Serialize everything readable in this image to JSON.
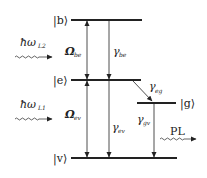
{
  "diagram": {
    "type": "energy-level",
    "levels": [
      {
        "id": "b",
        "label": "|b⟩",
        "y": 20,
        "x1": 71,
        "x2": 142
      },
      {
        "id": "e",
        "label": "|e⟩",
        "y": 80,
        "x1": 71,
        "x2": 141
      },
      {
        "id": "g",
        "label": "|g⟩",
        "y": 103,
        "x1": 137,
        "x2": 176
      },
      {
        "id": "v",
        "label": "|v⟩",
        "y": 158,
        "x1": 71,
        "x2": 177
      }
    ],
    "transitions": [
      {
        "id": "omega_be",
        "symbol": "Ω",
        "sub": "be",
        "kind": "coupling",
        "from": "b",
        "to": "e"
      },
      {
        "id": "gamma_be",
        "symbol": "γ",
        "sub": "be",
        "kind": "decay",
        "from": "b",
        "to": "e"
      },
      {
        "id": "omega_ev",
        "symbol": "Ω",
        "sub": "ev",
        "kind": "coupling",
        "from": "e",
        "to": "v"
      },
      {
        "id": "gamma_ev",
        "symbol": "γ",
        "sub": "ev",
        "kind": "decay",
        "from": "e",
        "to": "v"
      },
      {
        "id": "gamma_eg",
        "symbol": "γ",
        "sub": "eg",
        "kind": "decay",
        "from": "e",
        "to": "g"
      },
      {
        "id": "gamma_gv",
        "symbol": "γ",
        "sub": "gv",
        "kind": "decay",
        "from": "g",
        "to": "v"
      }
    ],
    "photons": [
      {
        "id": "laser2",
        "label": "ħω",
        "sub": "L2"
      },
      {
        "id": "laser1",
        "label": "ħω",
        "sub": "L1"
      },
      {
        "id": "pl",
        "label": "PL"
      }
    ],
    "colors": {
      "line": "#222222",
      "background": "#ffffff"
    }
  }
}
